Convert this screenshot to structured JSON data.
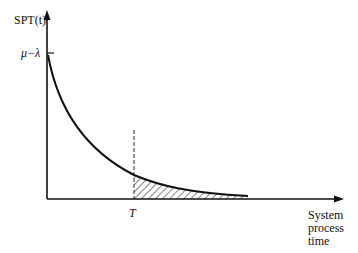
{
  "diagram": {
    "y_axis_label": "SPT(t)",
    "y_tick_label": "μ−λ",
    "x_marker_label": "T",
    "x_axis_label_lines": [
      "System",
      "process",
      "time"
    ],
    "curve": "exponential decay from μ−λ at t=0 approaching zero",
    "shaded_region": "area under curve for t ≥ T (hatched)",
    "colors": {
      "line": "#111111",
      "background": "#ffffff"
    }
  }
}
